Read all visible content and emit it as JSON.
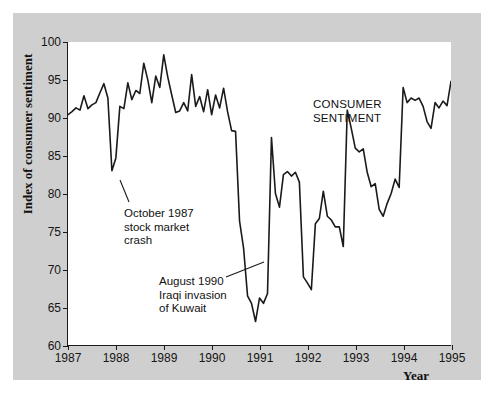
{
  "figure": {
    "panel_color": "#cfcfcf",
    "plot_background": "#ffffff",
    "line_color": "#1a1a1a"
  },
  "axes": {
    "ylabel": "Index of consumer sentiment",
    "xlabel": "Year",
    "yticks": [
      "60",
      "65",
      "70",
      "75",
      "80",
      "85",
      "90",
      "95",
      "100"
    ],
    "xticks": [
      "1987",
      "1988",
      "1989",
      "1990",
      "1991",
      "1992",
      "1993",
      "1994",
      "1995"
    ]
  },
  "annotations": {
    "series_label": {
      "line1": "CONSUMER",
      "line2": "SENTIMENT"
    },
    "crash": {
      "line1": "October 1987",
      "line2": "stock market",
      "line3": "crash"
    },
    "kuwait": {
      "line1": "August 1990",
      "line2": "Iraqi invasion",
      "line3": "of Kuwait"
    }
  },
  "chart_data": {
    "type": "line",
    "title": "",
    "subtitle": "",
    "xlabel": "Year",
    "ylabel": "Index of consumer sentiment",
    "xlim": [
      1987.0,
      1995.0
    ],
    "ylim": [
      60,
      100
    ],
    "ytick_values": [
      60,
      65,
      70,
      75,
      80,
      85,
      90,
      95,
      100
    ],
    "xtick_values": [
      1987,
      1988,
      1989,
      1990,
      1991,
      1992,
      1993,
      1994,
      1995
    ],
    "grid": false,
    "legend": "none",
    "annotations": [
      {
        "text": "CONSUMER SENTIMENT",
        "x": 1992.3,
        "y": 95.5,
        "type": "series-label"
      },
      {
        "text": "October 1987 stock market crash",
        "x": 1987.72,
        "y": 83.0,
        "type": "callout",
        "points_to_x": 1987.8,
        "points_to_y": 84.5
      },
      {
        "text": "August 1990 Iraqi invasion of Kuwait",
        "x": 1990.55,
        "y": 72.0,
        "type": "callout",
        "points_to_x": 1990.52,
        "points_to_y": 76.0
      }
    ],
    "series": [
      {
        "name": "Index of consumer sentiment",
        "color": "#1a1a1a",
        "x": [
          1987.0,
          1987.083,
          1987.167,
          1987.25,
          1987.333,
          1987.417,
          1987.5,
          1987.583,
          1987.667,
          1987.75,
          1987.833,
          1987.917,
          1988.0,
          1988.083,
          1988.167,
          1988.25,
          1988.333,
          1988.417,
          1988.5,
          1988.583,
          1988.667,
          1988.75,
          1988.833,
          1988.917,
          1989.0,
          1989.083,
          1989.167,
          1989.25,
          1989.333,
          1989.417,
          1989.5,
          1989.583,
          1989.667,
          1989.75,
          1989.833,
          1989.917,
          1990.0,
          1990.083,
          1990.167,
          1990.25,
          1990.333,
          1990.417,
          1990.5,
          1990.583,
          1990.667,
          1990.75,
          1990.833,
          1990.917,
          1991.0,
          1991.083,
          1991.167,
          1991.25,
          1991.333,
          1991.417,
          1991.5,
          1991.583,
          1991.667,
          1991.75,
          1991.833,
          1991.917,
          1992.0,
          1992.083,
          1992.167,
          1992.25,
          1992.333,
          1992.417,
          1992.5,
          1992.583,
          1992.667,
          1992.75,
          1992.833,
          1992.917,
          1993.0,
          1993.083,
          1993.167,
          1993.25,
          1993.333,
          1993.417,
          1993.5,
          1993.583,
          1993.667,
          1993.75,
          1993.833,
          1993.917,
          1994.0,
          1994.083,
          1994.167,
          1994.25,
          1994.333,
          1994.417,
          1994.5,
          1994.583,
          1994.667,
          1994.75,
          1994.833,
          1994.917,
          1995.0
        ],
        "y": [
          90.4,
          90.8,
          91.3,
          91.0,
          92.9,
          91.2,
          91.7,
          92.0,
          93.3,
          94.5,
          92.6,
          83.0,
          84.7,
          91.5,
          91.2,
          94.6,
          92.4,
          93.6,
          93.2,
          97.2,
          95.0,
          92.0,
          95.5,
          94.0,
          98.3,
          95.4,
          93.0,
          90.7,
          90.9,
          92.0,
          90.9,
          95.7,
          91.5,
          92.8,
          90.8,
          93.7,
          90.4,
          93.0,
          91.3,
          93.9,
          90.8,
          88.3,
          88.2,
          76.4,
          72.8,
          66.5,
          65.5,
          63.1,
          66.2,
          65.5,
          66.8,
          87.4,
          80.0,
          78.2,
          82.5,
          82.9,
          82.3,
          82.8,
          81.5,
          69.0,
          68.2,
          67.3,
          76.0,
          76.7,
          80.3,
          77.0,
          76.5,
          75.6,
          75.6,
          73.0,
          91.0,
          88.6,
          86.0,
          85.5,
          85.9,
          82.8,
          80.9,
          81.3,
          77.9,
          77.0,
          78.7,
          80.0,
          81.9,
          80.8,
          94.0,
          92.0,
          92.6,
          92.3,
          92.6,
          91.5,
          89.5,
          88.6,
          92.0,
          91.3,
          92.2,
          91.6,
          94.8
        ]
      }
    ]
  }
}
